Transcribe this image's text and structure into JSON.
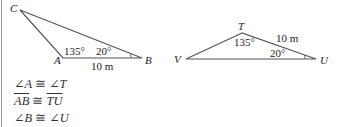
{
  "triangle1": {
    "vertices": {
      "C": "C",
      "A": "A",
      "B": "B"
    },
    "angle_A": "135°",
    "angle_B": "20°",
    "side_AB": "10 m"
  },
  "triangle2": {
    "vertices": {
      "T": "T",
      "V": "V",
      "U": "U"
    },
    "angle_T": "135°",
    "angle_U": "20°",
    "side_TU": "10 m"
  },
  "statements": [
    {
      "left": "∠A",
      "rel": "≅",
      "right": "∠T"
    },
    {
      "left": "AB",
      "rel": "≅",
      "right": "TU"
    },
    {
      "left": "∠B",
      "rel": "≅",
      "right": "∠U"
    }
  ],
  "colors": {
    "line": "#555555",
    "text": "#222222",
    "border": "#9a9a9a"
  }
}
